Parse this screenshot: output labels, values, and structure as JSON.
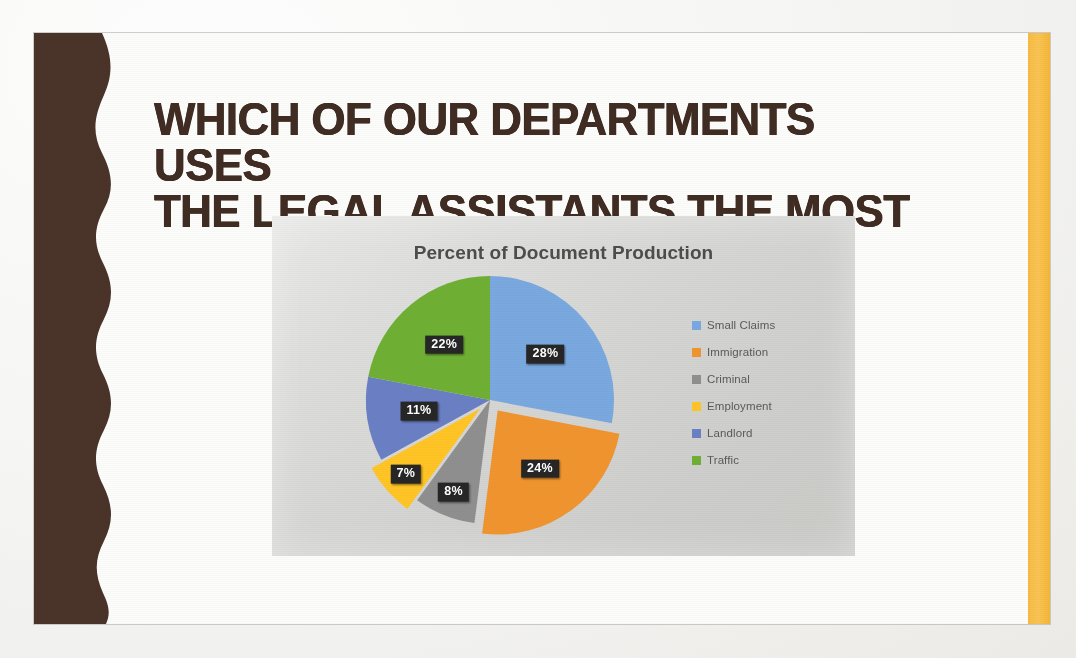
{
  "slide": {
    "title": "WHICH OF OUR DEPARTMENTS USES\nTHE LEGAL ASSISTANTS THE MOST",
    "title_color": "#402c22",
    "accent_bar_color": "#f7bb43",
    "band_color": "#4a3429",
    "background_color": "#fcfcfa"
  },
  "chart_data": {
    "type": "pie",
    "title": "Percent of Document Production",
    "categories": [
      "Small Claims",
      "Immigration",
      "Criminal",
      "Employment",
      "Landlord",
      "Traffic"
    ],
    "values": [
      28,
      24,
      8,
      7,
      11,
      22
    ],
    "value_labels": [
      "28%",
      "24%",
      "8%",
      "7%",
      "11%",
      "22%"
    ],
    "colors": [
      "#7aa9e0",
      "#f0942f",
      "#8f8f8f",
      "#ffc425",
      "#6b7fc4",
      "#6fb034"
    ],
    "exploded": [
      false,
      true,
      false,
      true,
      false,
      false
    ],
    "start_angle_deg": 0,
    "direction": "clockwise",
    "legend_position": "right",
    "data_label_style": "dark-chip-white-text",
    "units": "percent",
    "total": 100,
    "grid": false,
    "xlabel": "",
    "ylabel": ""
  },
  "legend": {
    "entries": [
      {
        "label": "Small Claims",
        "color": "#7aa9e0"
      },
      {
        "label": "Immigration",
        "color": "#f0942f"
      },
      {
        "label": "Criminal",
        "color": "#8f8f8f"
      },
      {
        "label": "Employment",
        "color": "#ffc425"
      },
      {
        "label": "Landlord",
        "color": "#6b7fc4"
      },
      {
        "label": "Traffic",
        "color": "#6fb034"
      }
    ]
  }
}
